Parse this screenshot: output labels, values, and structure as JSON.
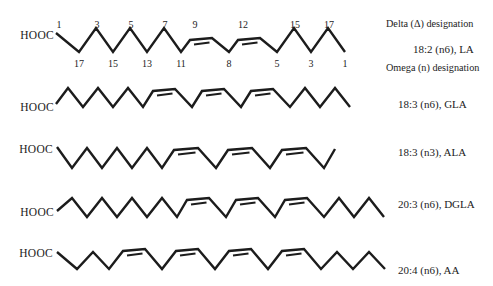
{
  "figure": {
    "width": 493,
    "height": 286,
    "background": "#ffffff",
    "ink": "#1c1c1c"
  },
  "annotations": [
    {
      "id": "delta-designation",
      "text": "Delta (Δ) designation",
      "x": 386,
      "y": 23
    },
    {
      "id": "omega-designation",
      "text": "Omega (n) designation",
      "x": 386,
      "y": 67
    }
  ],
  "molecules": [
    {
      "id": "la",
      "hooc": "HOOC",
      "hooc_x": 54,
      "hooc_y": 35,
      "label": {
        "text": "18:2 (n6), LA",
        "x": 413,
        "y": 49
      },
      "numbers_above_y": 24,
      "numbers_below_y": 63,
      "geom": {
        "startX": 56,
        "startY": 33,
        "peakY": 28,
        "valleyY": 52,
        "plateauY": 39,
        "step": 17,
        "firstStep": 23,
        "bApproach": 9,
        "bWidth": 22,
        "bDescend": 17,
        "endStep": 17
      },
      "carbons": [
        {
          "t": "s",
          "above": "1"
        },
        {
          "t": "d",
          "below": "17"
        },
        {
          "t": "u",
          "above": "3"
        },
        {
          "t": "d",
          "below": "15"
        },
        {
          "t": "u",
          "above": "5"
        },
        {
          "t": "d",
          "below": "13"
        },
        {
          "t": "u",
          "above": "7"
        },
        {
          "t": "d",
          "below": "11"
        },
        {
          "t": "bL",
          "above": "9"
        },
        {
          "t": "bR"
        },
        {
          "t": "d",
          "below": "8"
        },
        {
          "t": "bL",
          "above": "12"
        },
        {
          "t": "bR"
        },
        {
          "t": "d",
          "below": "5"
        },
        {
          "t": "u",
          "above": "15"
        },
        {
          "t": "d",
          "below": "3"
        },
        {
          "t": "u",
          "above": "17"
        },
        {
          "t": "e",
          "dir": "down",
          "below": "1"
        }
      ]
    },
    {
      "id": "gla",
      "hooc": "HOOC",
      "hooc_x": 54,
      "hooc_y": 107,
      "label": {
        "text": "18:3 (n6), GLA",
        "x": 398,
        "y": 104
      },
      "geom": {
        "startX": 56,
        "startY": 104,
        "peakY": 88,
        "valleyY": 107,
        "plateauY": 90,
        "step": 15,
        "firstStep": 12,
        "bApproach": 10,
        "bWidth": 22,
        "bDescend": 17,
        "endStep": 15
      },
      "carbons": [
        {
          "t": "s"
        },
        {
          "t": "u"
        },
        {
          "t": "d"
        },
        {
          "t": "u"
        },
        {
          "t": "d"
        },
        {
          "t": "u"
        },
        {
          "t": "d"
        },
        {
          "t": "bL"
        },
        {
          "t": "bR"
        },
        {
          "t": "d"
        },
        {
          "t": "bL"
        },
        {
          "t": "bR"
        },
        {
          "t": "d"
        },
        {
          "t": "bL"
        },
        {
          "t": "bR"
        },
        {
          "t": "d"
        },
        {
          "t": "u"
        },
        {
          "t": "d"
        },
        {
          "t": "u"
        },
        {
          "t": "e",
          "dir": "down"
        }
      ]
    },
    {
      "id": "ala",
      "hooc": "HOOC",
      "hooc_x": 53,
      "hooc_y": 149,
      "label": {
        "text": "18:3 (n3), ALA",
        "x": 398,
        "y": 152
      },
      "geom": {
        "startX": 57,
        "startY": 147,
        "peakY": 148,
        "valleyY": 168,
        "plateauY": 149,
        "step": 15,
        "firstStep": 15,
        "bApproach": 12,
        "bWidth": 24,
        "bDescend": 18,
        "endStep": 11
      },
      "carbons": [
        {
          "t": "s"
        },
        {
          "t": "d"
        },
        {
          "t": "u"
        },
        {
          "t": "d"
        },
        {
          "t": "u"
        },
        {
          "t": "d"
        },
        {
          "t": "u"
        },
        {
          "t": "d"
        },
        {
          "t": "bL"
        },
        {
          "t": "bR"
        },
        {
          "t": "d"
        },
        {
          "t": "bL"
        },
        {
          "t": "bR"
        },
        {
          "t": "d"
        },
        {
          "t": "bL"
        },
        {
          "t": "bR"
        },
        {
          "t": "d"
        },
        {
          "t": "e",
          "dir": "up"
        }
      ]
    },
    {
      "id": "dgla",
      "hooc": "HOOC",
      "hooc_x": 54,
      "hooc_y": 212,
      "label": {
        "text": "20:3 (n6), DGLA",
        "x": 398,
        "y": 204
      },
      "geom": {
        "startX": 57,
        "startY": 211,
        "peakY": 198,
        "valleyY": 217,
        "plateauY": 199,
        "step": 15,
        "firstStep": 15,
        "bApproach": 10,
        "bWidth": 22,
        "bDescend": 17,
        "endStep": 15
      },
      "carbons": [
        {
          "t": "s"
        },
        {
          "t": "u"
        },
        {
          "t": "d"
        },
        {
          "t": "u"
        },
        {
          "t": "d"
        },
        {
          "t": "u"
        },
        {
          "t": "d"
        },
        {
          "t": "u"
        },
        {
          "t": "d"
        },
        {
          "t": "bL"
        },
        {
          "t": "bR"
        },
        {
          "t": "d"
        },
        {
          "t": "bL"
        },
        {
          "t": "bR"
        },
        {
          "t": "d"
        },
        {
          "t": "bL"
        },
        {
          "t": "bR"
        },
        {
          "t": "d"
        },
        {
          "t": "u"
        },
        {
          "t": "d"
        },
        {
          "t": "u"
        },
        {
          "t": "e",
          "dir": "down"
        }
      ]
    },
    {
      "id": "aa",
      "hooc": "HOOC",
      "hooc_x": 53,
      "hooc_y": 253,
      "label": {
        "text": "20:4 (n6), AA",
        "x": 398,
        "y": 270
      },
      "geom": {
        "startX": 57,
        "startY": 252,
        "peakY": 252,
        "valleyY": 269,
        "plateauY": 250,
        "step": 16,
        "firstStep": 20,
        "bApproach": 14,
        "bWidth": 22,
        "bDescend": 17,
        "endStep": 16
      },
      "carbons": [
        {
          "t": "s"
        },
        {
          "t": "d"
        },
        {
          "t": "u"
        },
        {
          "t": "d"
        },
        {
          "t": "bL"
        },
        {
          "t": "bR"
        },
        {
          "t": "d"
        },
        {
          "t": "bL"
        },
        {
          "t": "bR"
        },
        {
          "t": "d"
        },
        {
          "t": "bL"
        },
        {
          "t": "bR"
        },
        {
          "t": "d"
        },
        {
          "t": "bL"
        },
        {
          "t": "bR"
        },
        {
          "t": "d"
        },
        {
          "t": "u"
        },
        {
          "t": "d"
        },
        {
          "t": "u"
        },
        {
          "t": "e",
          "dir": "down"
        }
      ]
    }
  ]
}
